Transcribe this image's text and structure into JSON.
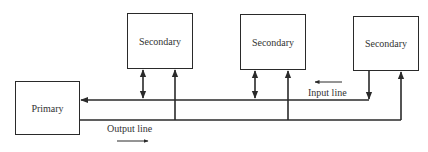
{
  "diagram": {
    "primary": {
      "label": "Primary"
    },
    "secondaries": [
      {
        "label": "Secondary"
      },
      {
        "label": "Secondary"
      },
      {
        "label": "Secondary"
      }
    ],
    "lines": {
      "input": {
        "label": "Input line",
        "direction": "left"
      },
      "output": {
        "label": "Output line",
        "direction": "right"
      }
    }
  }
}
